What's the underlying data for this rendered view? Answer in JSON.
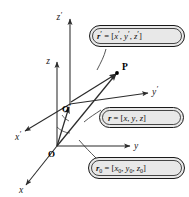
{
  "figure": {
    "background_color": "#ffffff",
    "line_color": "#2b2b2b",
    "callout_fill": "#e8e8e8",
    "callout_stroke": "#1a1a1a"
  },
  "axes": [
    {
      "id": "z-prime",
      "label": "z",
      "prime": "′",
      "description": "primed vertical axis"
    },
    {
      "id": "z",
      "label": "z",
      "prime": "",
      "description": "unprimed vertical axis"
    },
    {
      "id": "y-prime",
      "label": "y",
      "prime": "′",
      "description": "primed horizontal axis"
    },
    {
      "id": "y",
      "label": "y",
      "prime": "",
      "description": "unprimed horizontal axis"
    },
    {
      "id": "x-prime",
      "label": "x",
      "prime": "′",
      "description": "primed depth axis"
    },
    {
      "id": "x",
      "label": "x",
      "prime": "",
      "description": "unprimed depth axis"
    }
  ],
  "origins": [
    {
      "id": "origin-primed",
      "label": "O",
      "prime": "′"
    },
    {
      "id": "origin",
      "label": "O",
      "prime": ""
    }
  ],
  "point": {
    "label": "P"
  },
  "callouts": [
    {
      "id": "r-prime",
      "vector": "r",
      "vector_prime": "′",
      "equals": "=",
      "open": "[",
      "components": [
        {
          "name": "x",
          "prime": "′",
          "sub": ""
        },
        {
          "name": "y",
          "prime": "′",
          "sub": ""
        },
        {
          "name": "z",
          "prime": "′",
          "sub": ""
        }
      ],
      "close": "]",
      "full_text": "r′ = [x′, y′, z′]"
    },
    {
      "id": "r",
      "vector": "r",
      "vector_prime": "",
      "equals": "=",
      "open": "[",
      "components": [
        {
          "name": "x",
          "prime": "",
          "sub": ""
        },
        {
          "name": "y",
          "prime": "",
          "sub": ""
        },
        {
          "name": "z",
          "prime": "",
          "sub": ""
        }
      ],
      "close": "]",
      "full_text": "r = [x, y, z]"
    },
    {
      "id": "r-zero",
      "vector": "r",
      "vector_prime": "",
      "vector_sub": "0",
      "equals": "=",
      "open": "[",
      "components": [
        {
          "name": "x",
          "prime": "",
          "sub": "0"
        },
        {
          "name": "y",
          "prime": "",
          "sub": "0"
        },
        {
          "name": "z",
          "prime": "",
          "sub": "0"
        }
      ],
      "close": "]",
      "full_text": "r₀ = [x₀, y₀, z₀]"
    }
  ],
  "separators": {
    "comma": ","
  }
}
